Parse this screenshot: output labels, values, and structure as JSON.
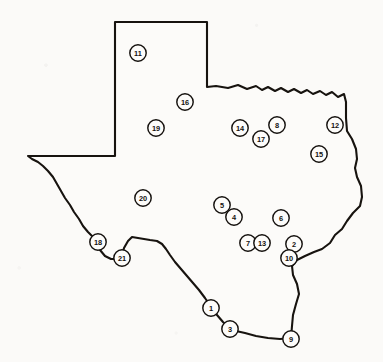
{
  "figure": {
    "name": "texas-site-location-map",
    "background_color": "#fbfaf8",
    "ink_color": "#17130f",
    "marker_fill_color": "#fdfcfa",
    "marker_count": 21
  },
  "chart_data": {
    "type": "scatter",
    "title": "",
    "subtitle": "",
    "xlabel": "",
    "ylabel": "",
    "grid": false,
    "legend_position": "none",
    "xlim": [
      0,
      383
    ],
    "ylim": [
      362,
      0
    ],
    "annotations": [],
    "categories": [
      "1",
      "2",
      "3",
      "4",
      "5",
      "6",
      "7",
      "8",
      "9",
      "10",
      "11",
      "12",
      "13",
      "14",
      "15",
      "16",
      "17",
      "18",
      "19",
      "20",
      "21"
    ],
    "points": [
      {
        "label": "1",
        "x": 211,
        "y": 308,
        "r": 8.2
      },
      {
        "label": "2",
        "x": 294,
        "y": 244,
        "r": 8.2
      },
      {
        "label": "3",
        "x": 230,
        "y": 329,
        "r": 8.2
      },
      {
        "label": "4",
        "x": 234,
        "y": 217,
        "r": 8.2
      },
      {
        "label": "5",
        "x": 222,
        "y": 205,
        "r": 8.2
      },
      {
        "label": "6",
        "x": 281,
        "y": 218,
        "r": 8.2
      },
      {
        "label": "7",
        "x": 248,
        "y": 243,
        "r": 8.2
      },
      {
        "label": "8",
        "x": 277,
        "y": 125,
        "r": 8.2
      },
      {
        "label": "9",
        "x": 291,
        "y": 339,
        "r": 8.2
      },
      {
        "label": "10",
        "x": 289,
        "y": 258,
        "r": 8.2
      },
      {
        "label": "11",
        "x": 138,
        "y": 53,
        "r": 8.2
      },
      {
        "label": "12",
        "x": 335,
        "y": 125,
        "r": 8.2
      },
      {
        "label": "13",
        "x": 262,
        "y": 243,
        "r": 8.2
      },
      {
        "label": "14",
        "x": 240,
        "y": 128,
        "r": 8.2
      },
      {
        "label": "15",
        "x": 319,
        "y": 154,
        "r": 8.2
      },
      {
        "label": "16",
        "x": 185,
        "y": 102,
        "r": 8.2
      },
      {
        "label": "17",
        "x": 261,
        "y": 139,
        "r": 8.2
      },
      {
        "label": "18",
        "x": 98,
        "y": 242,
        "r": 8.2
      },
      {
        "label": "19",
        "x": 156,
        "y": 128,
        "r": 8.2
      },
      {
        "label": "20",
        "x": 143,
        "y": 198,
        "r": 8.2
      },
      {
        "label": "21",
        "x": 122,
        "y": 258,
        "r": 8.2
      }
    ]
  }
}
